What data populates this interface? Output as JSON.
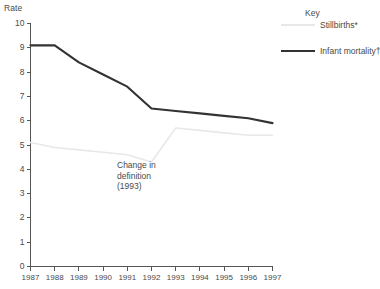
{
  "chart_data": {
    "type": "line",
    "title": "",
    "xlabel": "",
    "ylabel": "Rate",
    "categories": [
      "1987",
      "1988",
      "1989",
      "1990",
      "1991",
      "1992",
      "1993",
      "1994",
      "1995",
      "1996",
      "1997"
    ],
    "x": [
      1987,
      1988,
      1989,
      1990,
      1991,
      1992,
      1993,
      1994,
      1995,
      1996,
      1997
    ],
    "ylim": [
      0,
      10
    ],
    "yticks": [
      0,
      1,
      2,
      3,
      4,
      5,
      6,
      7,
      8,
      9,
      10
    ],
    "grid": false,
    "legend_position": "top-right",
    "series": [
      {
        "name": "Stillbirths*",
        "color": "#e8e8e8",
        "values": [
          5.1,
          4.9,
          4.8,
          4.7,
          4.6,
          4.3,
          5.7,
          5.6,
          5.5,
          5.4,
          5.4
        ]
      },
      {
        "name": "Infant mortality†",
        "color": "#333333",
        "values": [
          9.1,
          9.1,
          8.4,
          7.9,
          7.4,
          6.5,
          6.4,
          6.3,
          6.2,
          6.1,
          5.9
        ]
      }
    ],
    "annotations": [
      {
        "text_lines": [
          "Change in",
          "definition",
          "(1993)"
        ],
        "x": 1992,
        "y": 3.6
      }
    ]
  },
  "axis": {
    "y_title": "Rate",
    "y_tick_labels": [
      "10",
      "9",
      "8",
      "7",
      "6",
      "5",
      "4",
      "3",
      "2",
      "1",
      "0"
    ],
    "x_tick_labels": [
      "1987",
      "1988",
      "1989",
      "1990",
      "1991",
      "1992",
      "1993",
      "1994",
      "1995",
      "1996",
      "1997"
    ]
  },
  "legend": {
    "title": "Key",
    "entries": [
      {
        "label": "Stillbirths*",
        "swatch": "stillbirths"
      },
      {
        "label": "Infant mortality†",
        "swatch": "infant"
      }
    ]
  },
  "annotation": {
    "line1": "Change in",
    "line2": "definition",
    "line3": "(1993)"
  },
  "colors": {
    "stillbirths": "#e8e8e8",
    "infant_mortality": "#333333",
    "axis": "#555555",
    "text": "#4a4a4a",
    "background": "#ffffff"
  }
}
